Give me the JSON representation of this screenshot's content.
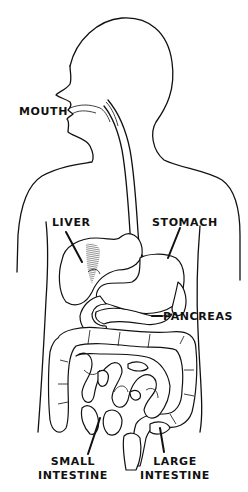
{
  "diagram": {
    "style": "black-and-white anatomical line drawing",
    "colors": {
      "ink": "#111111",
      "background": "#ffffff"
    },
    "labels": {
      "mouth": "MOUTH",
      "liver": "LIVER",
      "stomach": "STOMACH",
      "pancreas": "PANCREAS",
      "small_intestine_line1": "SMALL",
      "small_intestine_line2": "INTESTINE",
      "large_intestine_line1": "LARGE",
      "large_intestine_line2": "INTESTINE"
    },
    "parts": [
      "head-profile",
      "esophagus",
      "torso-outline",
      "liver",
      "stomach",
      "pancreas",
      "small-intestine",
      "large-intestine"
    ]
  }
}
